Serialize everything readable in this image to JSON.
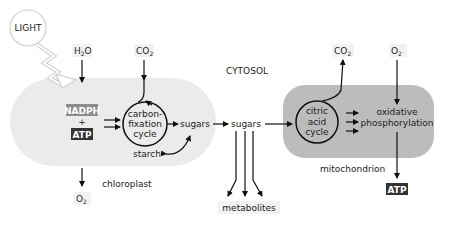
{
  "diagram": {
    "compartments": {
      "cytosol": {
        "label": "CYTOSOL"
      },
      "chloroplast": {
        "label": "chloroplast",
        "fill": "#ebebeb"
      },
      "mitochondrion": {
        "label": "mitochondrion",
        "fill": "#bcbcbc"
      }
    },
    "light": {
      "label": "LIGHT"
    },
    "inputs": {
      "water": {
        "main": "H",
        "sub": "2",
        "tail": "O"
      },
      "co2_in": {
        "main": "CO",
        "sub": "2"
      },
      "o2_in": {
        "main": "O",
        "sub": "2"
      }
    },
    "outputs": {
      "o2_out": {
        "main": "O",
        "sub": "2"
      },
      "co2_out": {
        "main": "CO",
        "sub": "2"
      },
      "atp_out": {
        "label": "ATP"
      },
      "metabolites": {
        "label": "metabolites"
      }
    },
    "chloroplast_nodes": {
      "nadph": {
        "label": "NADPH",
        "fill": "#8c8c8c"
      },
      "plus": {
        "label": "+"
      },
      "atp": {
        "label": "ATP",
        "fill": "#333333"
      },
      "cycle": {
        "line1": "carbon-",
        "line2": "fixation",
        "line3": "cycle"
      },
      "sugars": {
        "label": "sugars"
      },
      "starch": {
        "label": "starch"
      }
    },
    "cytosol_nodes": {
      "sugars": {
        "label": "sugars"
      }
    },
    "mitochondrion_nodes": {
      "cycle": {
        "line1": "citric",
        "line2": "acid",
        "line3": "cycle"
      },
      "oxphos": {
        "line1": "oxidative",
        "line2": "phosphorylation"
      }
    }
  }
}
